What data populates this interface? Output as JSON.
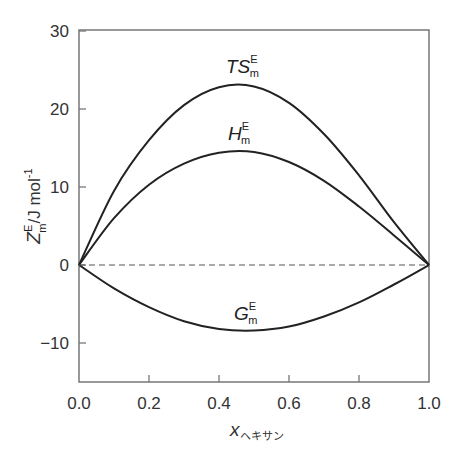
{
  "chart_data": {
    "type": "line",
    "title": "",
    "xlabel": "x_ヘキサン",
    "xlabel_main": "x",
    "xlabel_sub": "ヘキサン",
    "ylabel": "Z^E_m / J mol^-1",
    "ylabel_main": "Z",
    "ylabel_sup": "E",
    "ylabel_sub": "m",
    "ylabel_unit": "/J mol",
    "ylabel_unit_sup": "-1",
    "xlim": [
      0.0,
      1.0
    ],
    "ylim": [
      -15,
      30
    ],
    "x_ticks": [
      "0.0",
      "0.2",
      "0.4",
      "0.6",
      "0.8",
      "1.0"
    ],
    "y_ticks": [
      "−10",
      "0",
      "10",
      "20",
      "30"
    ],
    "grid": false,
    "legend": "none (inline curve labels)",
    "x": [
      0.0,
      0.1,
      0.2,
      0.3,
      0.4,
      0.5,
      0.6,
      0.7,
      0.8,
      0.9,
      1.0
    ],
    "series": [
      {
        "name": "TS^E_m",
        "label_main": "TS",
        "label_sup": "E",
        "label_sub": "m",
        "style": "solid",
        "values": [
          0,
          9.5,
          16.0,
          20.5,
          22.8,
          22.9,
          20.8,
          16.8,
          11.5,
          5.5,
          0
        ]
      },
      {
        "name": "H^E_m",
        "label_main": "H",
        "label_sup": "E",
        "label_sub": "m",
        "style": "solid",
        "values": [
          0,
          6.0,
          10.3,
          13.0,
          14.4,
          14.5,
          13.2,
          10.8,
          7.5,
          3.8,
          0
        ]
      },
      {
        "name": "G^E_m",
        "label_main": "G",
        "label_sup": "E",
        "label_sub": "m",
        "style": "solid",
        "values": [
          0,
          -3.0,
          -5.4,
          -7.2,
          -8.2,
          -8.4,
          -7.9,
          -6.6,
          -4.8,
          -2.5,
          0
        ]
      },
      {
        "name": "zero line",
        "style": "dashed",
        "values": [
          0,
          0,
          0,
          0,
          0,
          0,
          0,
          0,
          0,
          0,
          0
        ]
      }
    ]
  }
}
